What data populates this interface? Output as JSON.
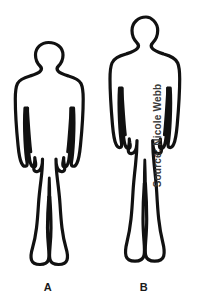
{
  "image": {
    "type": "line-illustration",
    "background_color": "#ffffff",
    "outline_color": "#111111",
    "width": 207,
    "height": 308
  },
  "figures": [
    {
      "id": "figure-a",
      "label": "A",
      "description": "human body silhouette outline, shorter and broader build",
      "label_x": 48,
      "label_y": 288
    },
    {
      "id": "figure-b",
      "label": "B",
      "description": "human body silhouette outline, taller and slimmer build",
      "label_x": 144,
      "label_y": 288
    }
  ],
  "credit": {
    "text": "Source: Nicole Webb",
    "orientation": "vertical-rotated-90",
    "color": "#3a3a3a"
  }
}
